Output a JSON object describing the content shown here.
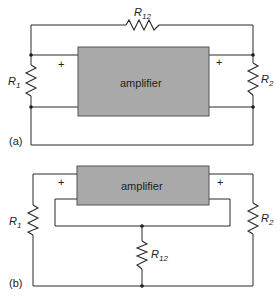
{
  "diagram_a": {
    "panel_label": "(a)",
    "amplifier_label": "amplifier",
    "resistors": [
      {
        "name": "R",
        "sub": "12",
        "position": "top feedback"
      },
      {
        "name": "R",
        "sub": "1",
        "position": "input"
      },
      {
        "name": "R",
        "sub": "2",
        "position": "output"
      }
    ],
    "polarity": [
      "+",
      "+"
    ]
  },
  "diagram_b": {
    "panel_label": "(b)",
    "amplifier_label": "amplifier",
    "resistors": [
      {
        "name": "R",
        "sub": "1",
        "position": "input"
      },
      {
        "name": "R",
        "sub": "2",
        "position": "output"
      },
      {
        "name": "R",
        "sub": "12",
        "position": "common ground"
      }
    ],
    "polarity": [
      "+",
      "+"
    ]
  },
  "colors": {
    "amplifier_fill": "#a9a9a9",
    "wire": "#2a2a2a"
  }
}
